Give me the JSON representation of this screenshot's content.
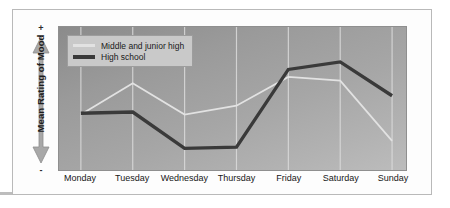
{
  "figure": {
    "y_axis": {
      "label": "Mean Rating of Mood",
      "positive_marker": "+",
      "negative_marker": "-",
      "arrow_icon": "double-headed-vertical-arrow-icon"
    },
    "legend": {
      "entries": [
        {
          "label": "Middle and junior high",
          "color": "#e2e2e2",
          "weight": "thin"
        },
        {
          "label": "High school",
          "color": "#3a3a3a",
          "weight": "thick"
        }
      ]
    }
  },
  "chart_data": {
    "type": "line",
    "title": "",
    "xlabel": "",
    "ylabel": "Mean Rating of Mood",
    "categories": [
      "Monday",
      "Tuesday",
      "Wednesday",
      "Thursday",
      "Friday",
      "Saturday",
      "Sunday"
    ],
    "ylim": [
      0,
      100
    ],
    "y_axis_is_qualitative": true,
    "y_axis_low_label": "-",
    "y_axis_high_label": "+",
    "grid": true,
    "grid_orientation": "vertical",
    "legend_position": "top-left",
    "series": [
      {
        "name": "Middle and junior high",
        "color": "#e2e2e2",
        "values": [
          38,
          63,
          38,
          45,
          68,
          65,
          17
        ]
      },
      {
        "name": "High school",
        "color": "#3a3a3a",
        "values": [
          39,
          40,
          11,
          12,
          74,
          80,
          53
        ]
      }
    ]
  }
}
